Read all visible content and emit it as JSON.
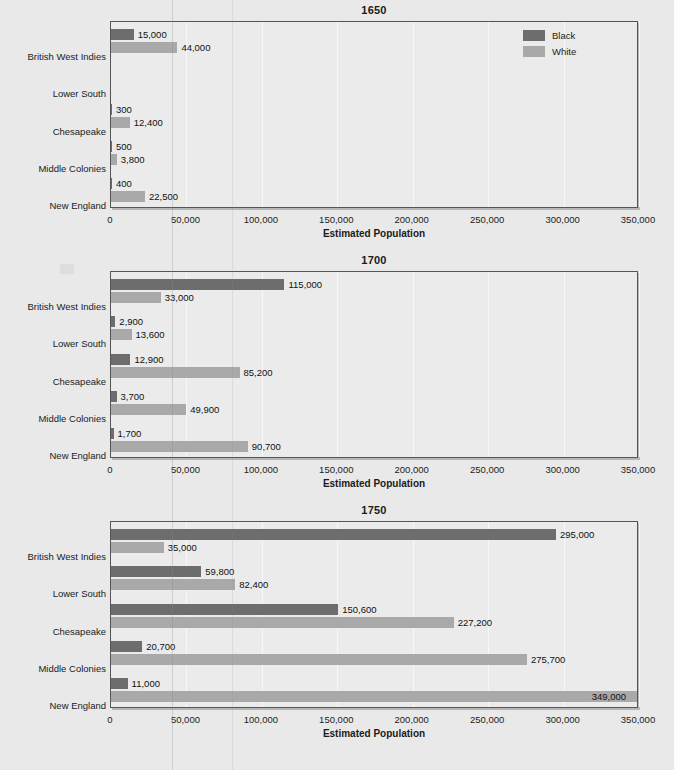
{
  "chart_data": [
    {
      "type": "bar",
      "orientation": "horizontal",
      "title": "1650",
      "xlabel": "Estimated Population",
      "ylabel": "",
      "xlim": [
        0,
        350000
      ],
      "xticks": [
        0,
        50000,
        100000,
        150000,
        200000,
        250000,
        300000,
        350000
      ],
      "xtick_labels": [
        "0",
        "50,000",
        "100,000",
        "150,000",
        "200,000",
        "250,000",
        "300,000",
        "350,000"
      ],
      "grid": true,
      "legend": "top-right",
      "categories": [
        "British West Indies",
        "Lower South",
        "Chesapeake",
        "Middle Colonies",
        "New England"
      ],
      "series": [
        {
          "name": "Black",
          "color": "#6d6d6d",
          "values": [
            15000,
            null,
            300,
            500,
            400
          ],
          "labels": [
            "15,000",
            "",
            "300",
            "500",
            "400"
          ]
        },
        {
          "name": "White",
          "color": "#a9a9a9",
          "values": [
            44000,
            null,
            12400,
            3800,
            22500
          ],
          "labels": [
            "44,000",
            "",
            "12,400",
            "3,800",
            "22,500"
          ]
        }
      ]
    },
    {
      "type": "bar",
      "orientation": "horizontal",
      "title": "1700",
      "xlabel": "Estimated Population",
      "ylabel": "",
      "xlim": [
        0,
        350000
      ],
      "xticks": [
        0,
        50000,
        100000,
        150000,
        200000,
        250000,
        300000,
        350000
      ],
      "xtick_labels": [
        "0",
        "50,000",
        "100,000",
        "150,000",
        "200,000",
        "250,000",
        "300,000",
        "350,000"
      ],
      "grid": true,
      "legend": "none",
      "categories": [
        "British West Indies",
        "Lower South",
        "Chesapeake",
        "Middle Colonies",
        "New England"
      ],
      "series": [
        {
          "name": "Black",
          "color": "#6d6d6d",
          "values": [
            115000,
            2900,
            12900,
            3700,
            1700
          ],
          "labels": [
            "115,000",
            "2,900",
            "12,900",
            "3,700",
            "1,700"
          ]
        },
        {
          "name": "White",
          "color": "#a9a9a9",
          "values": [
            33000,
            13600,
            85200,
            49900,
            90700
          ],
          "labels": [
            "33,000",
            "13,600",
            "85,200",
            "49,900",
            "90,700"
          ]
        }
      ]
    },
    {
      "type": "bar",
      "orientation": "horizontal",
      "title": "1750",
      "xlabel": "Estimated Population",
      "ylabel": "",
      "xlim": [
        0,
        350000
      ],
      "xticks": [
        0,
        50000,
        100000,
        150000,
        200000,
        250000,
        300000,
        350000
      ],
      "xtick_labels": [
        "0",
        "50,000",
        "100,000",
        "150,000",
        "200,000",
        "250,000",
        "300,000",
        "350,000"
      ],
      "grid": true,
      "legend": "none",
      "categories": [
        "British West Indies",
        "Lower South",
        "Chesapeake",
        "Middle Colonies",
        "New England"
      ],
      "series": [
        {
          "name": "Black",
          "color": "#6d6d6d",
          "values": [
            295000,
            59800,
            150600,
            20700,
            11000
          ],
          "labels": [
            "295,000",
            "59,800",
            "150,600",
            "20,700",
            "11,000"
          ]
        },
        {
          "name": "White",
          "color": "#a9a9a9",
          "values": [
            35000,
            82400,
            227200,
            275700,
            349000
          ],
          "labels": [
            "35,000",
            "82,400",
            "227,200",
            "275,700",
            "349,000"
          ]
        }
      ]
    }
  ],
  "legend": {
    "items": [
      {
        "label": "Black",
        "color": "#6d6d6d"
      },
      {
        "label": "White",
        "color": "#a9a9a9"
      }
    ]
  },
  "colors": {
    "black_series": "#6d6d6d",
    "white_series": "#a9a9a9",
    "plot_background": "#ebebeb",
    "page_background": "#e9e9e9",
    "axis": "#555555",
    "gridline": "#f7f7f7"
  }
}
